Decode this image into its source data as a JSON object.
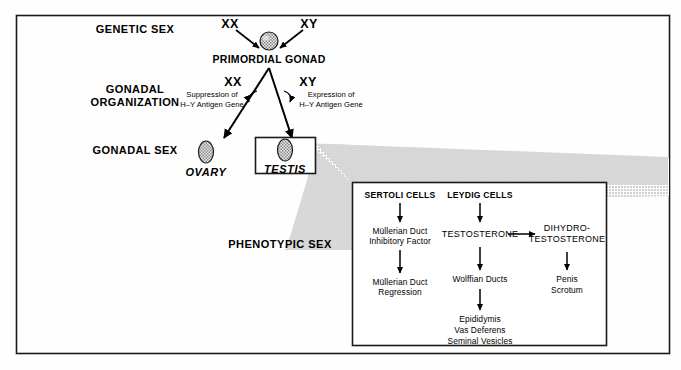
{
  "figure": {
    "title_implicit": "Sexual differentiation pathway",
    "stage_labels": [
      {
        "id": "genetic-sex",
        "text": "GENETIC SEX"
      },
      {
        "id": "gonadal-organization",
        "line1": "GONADAL",
        "line2": "ORGANIZATION"
      },
      {
        "id": "gonadal-sex",
        "text": "GONADAL SEX"
      },
      {
        "id": "phenotypic-sex",
        "text": "PHENOTYPIC SEX"
      }
    ],
    "genetic_sex": {
      "karyotype_left": "XX",
      "karyotype_right": "XY",
      "gonad_label": "PRIMORDIAL GONAD"
    },
    "gonadal_organization": {
      "karyotype_left": "XX",
      "karyotype_right": "XY",
      "annotation_left_line1": "Suppression of",
      "annotation_left_line2": "H–Y Antigen Gene",
      "annotation_right_line1": "Expression of",
      "annotation_right_line2": "H–Y Antigen Gene"
    },
    "gonadal_sex": {
      "ovary_label": "OVARY",
      "testis_label": "TESTIS"
    },
    "inset": {
      "sertoli": {
        "heading": "SERTOLI CELLS",
        "step1_line1": "Müllerian Duct",
        "step1_line2": "Inhibitory Factor",
        "step2_line1": "Müllerian Duct",
        "step2_line2": "Regression"
      },
      "leydig": {
        "heading": "LEYDIG CELLS",
        "testosterone": "TESTOSTERONE",
        "dihydro_line1": "DIHYDRO-",
        "dihydro_line2": "TESTOSTERONE",
        "wolffian": "Wolffian Ducts",
        "derivatives_line1": "Epididymis",
        "derivatives_line2": "Vas Deferens",
        "derivatives_line3": "Seminal Vesicles",
        "external_line1": "Penis",
        "external_line2": "Scrotum"
      }
    },
    "colors": {
      "ink": "#000000",
      "page": "#fefefe",
      "shade": "#d2d2d2",
      "frame": "#111111"
    }
  }
}
